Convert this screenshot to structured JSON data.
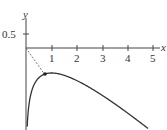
{
  "chart_data": {
    "type": "line",
    "title": "",
    "xlabel": "x",
    "ylabel": "y",
    "xlim": [
      0,
      5.2
    ],
    "ylim": [
      -3.2,
      0.8
    ],
    "x_ticks": [
      "1",
      "2",
      "3",
      "4",
      "5"
    ],
    "y_ticks": [
      "0.5"
    ],
    "grid": false,
    "series": [
      {
        "name": "curve",
        "function": "y = ln(x) - x",
        "x": [
          0.05,
          0.25,
          0.5,
          0.75,
          1,
          1.5,
          2,
          2.5,
          3,
          3.5,
          4,
          4.5,
          4.75
        ],
        "values": [
          -3.05,
          -1.64,
          -1.19,
          -1.04,
          -1.0,
          -1.09,
          -1.31,
          -1.58,
          -1.9,
          -2.25,
          -2.61,
          -2.99,
          -3.19
        ]
      }
    ],
    "annotations": [
      {
        "type": "dashed-line",
        "from": [
          0,
          0
        ],
        "to": [
          0.75,
          -1.04
        ]
      },
      {
        "type": "point",
        "at": [
          0.75,
          -1.04
        ]
      }
    ]
  },
  "axes": {
    "x_label": "x",
    "y_label": "y",
    "x_tick_labels": [
      "1",
      "2",
      "3",
      "4",
      "5"
    ],
    "y_tick_label": "0.5"
  }
}
